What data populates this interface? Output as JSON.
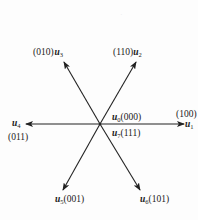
{
  "diagram": {
    "type": "space-vector-hexagon",
    "center": {
      "x": 100,
      "y": 124
    },
    "line_color": "#222222",
    "vectors": [
      {
        "id": "u1",
        "symbol": "u",
        "subscript": "1",
        "state": "(100)",
        "tip": {
          "x": 184,
          "y": 124
        }
      },
      {
        "id": "u2",
        "symbol": "u",
        "subscript": "2",
        "state": "(110)",
        "tip": {
          "x": 136,
          "y": 62
        }
      },
      {
        "id": "u3",
        "symbol": "u",
        "subscript": "3",
        "state": "(010)",
        "tip": {
          "x": 64,
          "y": 62
        }
      },
      {
        "id": "u4",
        "symbol": "u",
        "subscript": "4",
        "state": "(011)",
        "tip": {
          "x": 26,
          "y": 124
        }
      },
      {
        "id": "u5",
        "symbol": "u",
        "subscript": "5",
        "state": "(001)",
        "tip": {
          "x": 63,
          "y": 190
        }
      },
      {
        "id": "u6",
        "symbol": "u",
        "subscript": "6",
        "state": "(101)",
        "tip": {
          "x": 140,
          "y": 190
        }
      }
    ],
    "zero_vectors": [
      {
        "id": "u0",
        "symbol": "u",
        "subscript": "0",
        "state": "(000)"
      },
      {
        "id": "u7",
        "symbol": "u",
        "subscript": "7",
        "state": "(111)"
      }
    ]
  }
}
